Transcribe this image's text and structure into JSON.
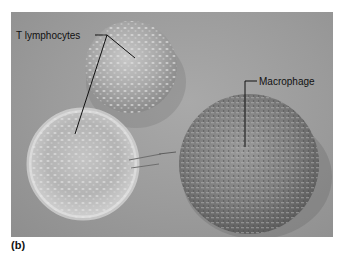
{
  "figure": {
    "panel_label": "(b)",
    "annotations": [
      {
        "label": "T lymphocytes",
        "target": "two T lymphocyte cells (upper-center and lower-left)"
      },
      {
        "label": "Macrophage",
        "target": "large cell at lower-right"
      }
    ],
    "cells": [
      {
        "type": "T lymphocyte",
        "position": "upper-center"
      },
      {
        "type": "T lymphocyte",
        "position": "lower-left"
      },
      {
        "type": "Macrophage",
        "position": "lower-right"
      }
    ],
    "colors": {
      "background": "#9b9b9b",
      "label_text": "#111111",
      "leader_line": "#111111"
    }
  }
}
